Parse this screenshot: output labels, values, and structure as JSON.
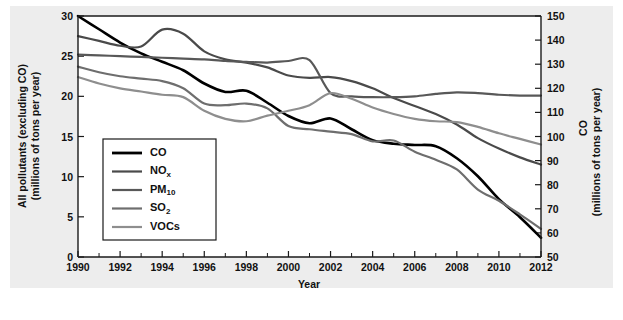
{
  "chart_data": {
    "type": "line",
    "title": "",
    "xlabel": "Year",
    "ylabel_left": "All pollutants (excluding CO) (millions of tons per year)",
    "ylabel_left_line1": "All pollutants (excluding CO)",
    "ylabel_left_line2": "(millions of tons per year)",
    "ylabel_right": "CO (millions of tons per year)",
    "ylabel_right_line1": "CO",
    "ylabel_right_line2": "(millions of tons per year)",
    "grid": false,
    "legend_position": "lower-left-inside",
    "xlim": [
      1990,
      2012
    ],
    "ylim_left": [
      0,
      30
    ],
    "ylim_right": [
      50,
      150
    ],
    "x_ticks": [
      1990,
      1992,
      1994,
      1996,
      1998,
      2000,
      2002,
      2004,
      2006,
      2008,
      2010,
      2012
    ],
    "x_tick_labels": [
      "1990",
      "1992",
      "1994",
      "1996",
      "1998",
      "2000",
      "2002",
      "2004",
      "2006",
      "2008",
      "2010",
      "2012"
    ],
    "x_minor_ticks": [
      1991,
      1993,
      1995,
      1997,
      1999,
      2001,
      2003,
      2005,
      2007,
      2009,
      2011
    ],
    "y_ticks_left": [
      0,
      5,
      10,
      15,
      20,
      25,
      30
    ],
    "y_tick_labels_left": [
      "0",
      "5",
      "10",
      "15",
      "20",
      "25",
      "30"
    ],
    "y_ticks_right": [
      50,
      60,
      70,
      80,
      90,
      100,
      110,
      120,
      130,
      140,
      150
    ],
    "y_tick_labels_right": [
      "50",
      "60",
      "70",
      "80",
      "90",
      "100",
      "110",
      "120",
      "130",
      "140",
      "150"
    ],
    "x": [
      1990,
      1991,
      1992,
      1993,
      1994,
      1995,
      1996,
      1997,
      1998,
      1999,
      2000,
      2001,
      2002,
      2003,
      2004,
      2005,
      2006,
      2007,
      2008,
      2009,
      2010,
      2011,
      2012
    ],
    "series": [
      {
        "name": "CO",
        "label": "CO",
        "axis": "right",
        "color": "#000000",
        "width": 2.6,
        "values": [
          150,
          144.5,
          139,
          134.5,
          131,
          127.5,
          122,
          118.5,
          119,
          114,
          108.5,
          105.5,
          107.5,
          103,
          98.5,
          97,
          96.5,
          96,
          91,
          83.5,
          74,
          66.5,
          58
        ]
      },
      {
        "name": "NOx",
        "label": "NO",
        "label_sub": "x",
        "axis": "left",
        "color": "#4a4a4a",
        "width": 2.2,
        "values": [
          27.5,
          26.9,
          26.3,
          26.2,
          28.3,
          27.8,
          25.6,
          24.6,
          24.2,
          23.6,
          22.6,
          22.3,
          22.4,
          21.9,
          21.0,
          19.8,
          18.8,
          17.8,
          16.5,
          14.8,
          13.5,
          12.4,
          11.5
        ]
      },
      {
        "name": "PM10",
        "label": "PM",
        "label_sub": "10",
        "axis": "left",
        "color": "#585858",
        "width": 2.2,
        "values": [
          25.2,
          25.1,
          25.0,
          24.9,
          24.8,
          24.7,
          24.6,
          24.4,
          24.3,
          24.2,
          24.4,
          24.5,
          20.4,
          20.0,
          19.9,
          19.9,
          20.0,
          20.3,
          20.5,
          20.4,
          20.2,
          20.1,
          20.1
        ]
      },
      {
        "name": "SO2",
        "label": "SO",
        "label_sub": "2",
        "axis": "left",
        "color": "#6e6e6e",
        "width": 2.2,
        "values": [
          23.7,
          23.0,
          22.5,
          22.2,
          21.9,
          21.0,
          19.1,
          18.9,
          19.1,
          18.5,
          16.3,
          15.9,
          15.6,
          15.3,
          14.4,
          14.5,
          13.1,
          12.1,
          10.9,
          8.4,
          7.0,
          5.3,
          3.5
        ]
      },
      {
        "name": "VOCs",
        "label": "VOCs",
        "axis": "left",
        "color": "#8e8e8e",
        "width": 2.2,
        "values": [
          22.4,
          21.6,
          21.0,
          20.6,
          20.2,
          19.9,
          18.2,
          17.2,
          16.9,
          17.6,
          18.2,
          18.9,
          20.4,
          19.7,
          18.6,
          17.8,
          17.2,
          16.9,
          16.8,
          16.2,
          15.4,
          14.7,
          14.0
        ]
      }
    ],
    "legend_entries": [
      {
        "label": "CO",
        "sub": "",
        "color": "#000000",
        "width": 2.8
      },
      {
        "label": "NO",
        "sub": "x",
        "color": "#4a4a4a",
        "width": 2.2
      },
      {
        "label": "PM",
        "sub": "10",
        "color": "#585858",
        "width": 2.2
      },
      {
        "label": "SO",
        "sub": "2",
        "color": "#6e6e6e",
        "width": 2.2
      },
      {
        "label": "VOCs",
        "sub": "",
        "color": "#8e8e8e",
        "width": 2.2
      }
    ]
  },
  "figure": {
    "background": "#ededed",
    "plot_background": "#ffffff",
    "axis_color": "#1a1a1a"
  }
}
